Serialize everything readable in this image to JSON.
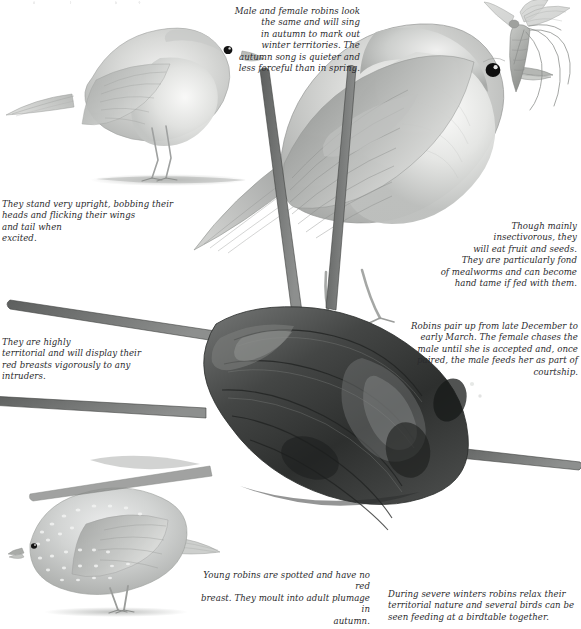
{
  "plate": {
    "title": "Robins",
    "medium": "pencil illustration",
    "palette": {
      "paper": "#ffffff",
      "ink": "#2b2b2e",
      "pencil_light": "#cfd0cf",
      "pencil_mid": "#9a9c9b",
      "pencil_dark": "#4d4f4e",
      "log_dark": "#3a3a39",
      "eye_black": "#131313"
    },
    "cropped_text_top": ""
  },
  "captions": [
    {
      "id": "song-territory",
      "align": "right",
      "text": "Male and female robins look\nthe same and will sing\nin autumn to mark out\nwinter territories. The\nautumn song is quieter and\nless forceful than in spring."
    },
    {
      "id": "posture",
      "align": "left",
      "text": "They stand very upright, bobbing their\nheads and flicking their wings\nand tail when\nexcited."
    },
    {
      "id": "diet",
      "align": "right",
      "text": "Though mainly\ninsectivorous, they\nwill eat fruit and seeds.\nThey are particularly fond\nof mealworms and can become\nhand tame if fed with them."
    },
    {
      "id": "territorial",
      "align": "left",
      "text": "They are highly\nterritorial and will display their\nred breasts vigorously to any\nintruders."
    },
    {
      "id": "pairing",
      "align": "right",
      "text": "Robins pair up from late December to\nearly March. The female chases the\nmale until she is accepted and, once\npaired, the male feeds her as part of\ncourtship."
    },
    {
      "id": "juvenile",
      "align": "right",
      "text": "Young robins are spotted and have no red\nbreast. They moult into adult plumage in\nautumn."
    },
    {
      "id": "winter",
      "align": "left",
      "text": "During severe winters robins relax their\nterritorial nature and several birds can be\nseen feeding at a birdtable together."
    }
  ],
  "figures": [
    {
      "id": "adult-robin-left",
      "label": "adult robin standing on ground, facing right"
    },
    {
      "id": "adult-robin-main",
      "label": "large adult robin perched on log holding a crane fly in its beak"
    },
    {
      "id": "crane-fly",
      "label": "crane fly (daddy-long-legs) held in the robin's beak"
    },
    {
      "id": "log-perch",
      "label": "dark weathered log stump with radiating cut branches"
    },
    {
      "id": "juvenile-robin",
      "label": "speckled juvenile robin, no red breast"
    }
  ]
}
